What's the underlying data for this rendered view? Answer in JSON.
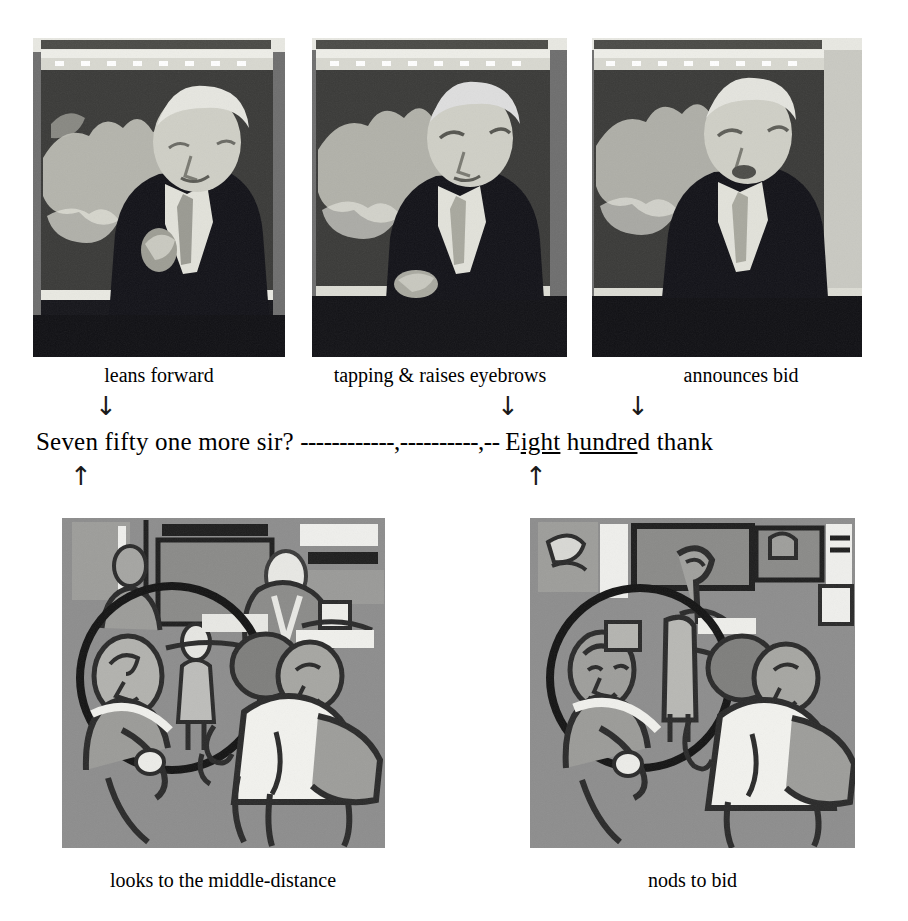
{
  "figure": {
    "top_row": {
      "frames": [
        {
          "id": "frame-1",
          "caption": "leans forward",
          "scene": "auctioneer at rostrum leaning forward, hand raised"
        },
        {
          "id": "frame-2",
          "caption": "tapping & raises eyebrows",
          "scene": "auctioneer tapping rostrum, eyebrows raised"
        },
        {
          "id": "frame-3",
          "caption": "announces bid",
          "scene": "auctioneer turning, announcing the bid"
        }
      ]
    },
    "annotation_arrows": {
      "down": [
        {
          "name": "arrow-down-leans-forward",
          "glyph": "↓"
        },
        {
          "name": "arrow-down-tapping",
          "glyph": "↓"
        },
        {
          "name": "arrow-down-announces-bid",
          "glyph": "↓"
        }
      ],
      "up": [
        {
          "name": "arrow-up-looks-middle-distance",
          "glyph": "↑"
        },
        {
          "name": "arrow-up-nods-to-bid",
          "glyph": "↑"
        }
      ]
    },
    "transcript": {
      "segments": [
        {
          "text": "Seven fifty one more sir? ",
          "underline": false
        },
        {
          "text": "------------,----------,-- ",
          "underline": false
        },
        {
          "text": "E",
          "underline": false
        },
        {
          "text": "ight",
          "underline": true
        },
        {
          "text": " h",
          "underline": false
        },
        {
          "text": "undre",
          "underline": true
        },
        {
          "text": "d thank",
          "underline": false
        }
      ],
      "plain": "Seven fifty one more sir? ------------,----------,-- Eight hundred thank"
    },
    "bottom_row": {
      "frames": [
        {
          "id": "frame-4",
          "caption": "looks to the middle-distance",
          "scene": "traced line drawing of auction room audience, circle highlighting seated bidder looking ahead"
        },
        {
          "id": "frame-5",
          "caption": "nods to bid",
          "scene": "traced line drawing of auction room audience, circle highlighting bidder nodding"
        }
      ]
    },
    "colors": {
      "page_background": "#ffffff",
      "text": "#000000",
      "photo_mid": "#6e6e6e",
      "photo_dark": "#1c1c1c",
      "photo_light": "#d8d8d2",
      "drawing_background": "#8d8d8d",
      "drawing_ink": "#1b1b1b",
      "drawing_highlight": "#f1f1ee"
    }
  }
}
